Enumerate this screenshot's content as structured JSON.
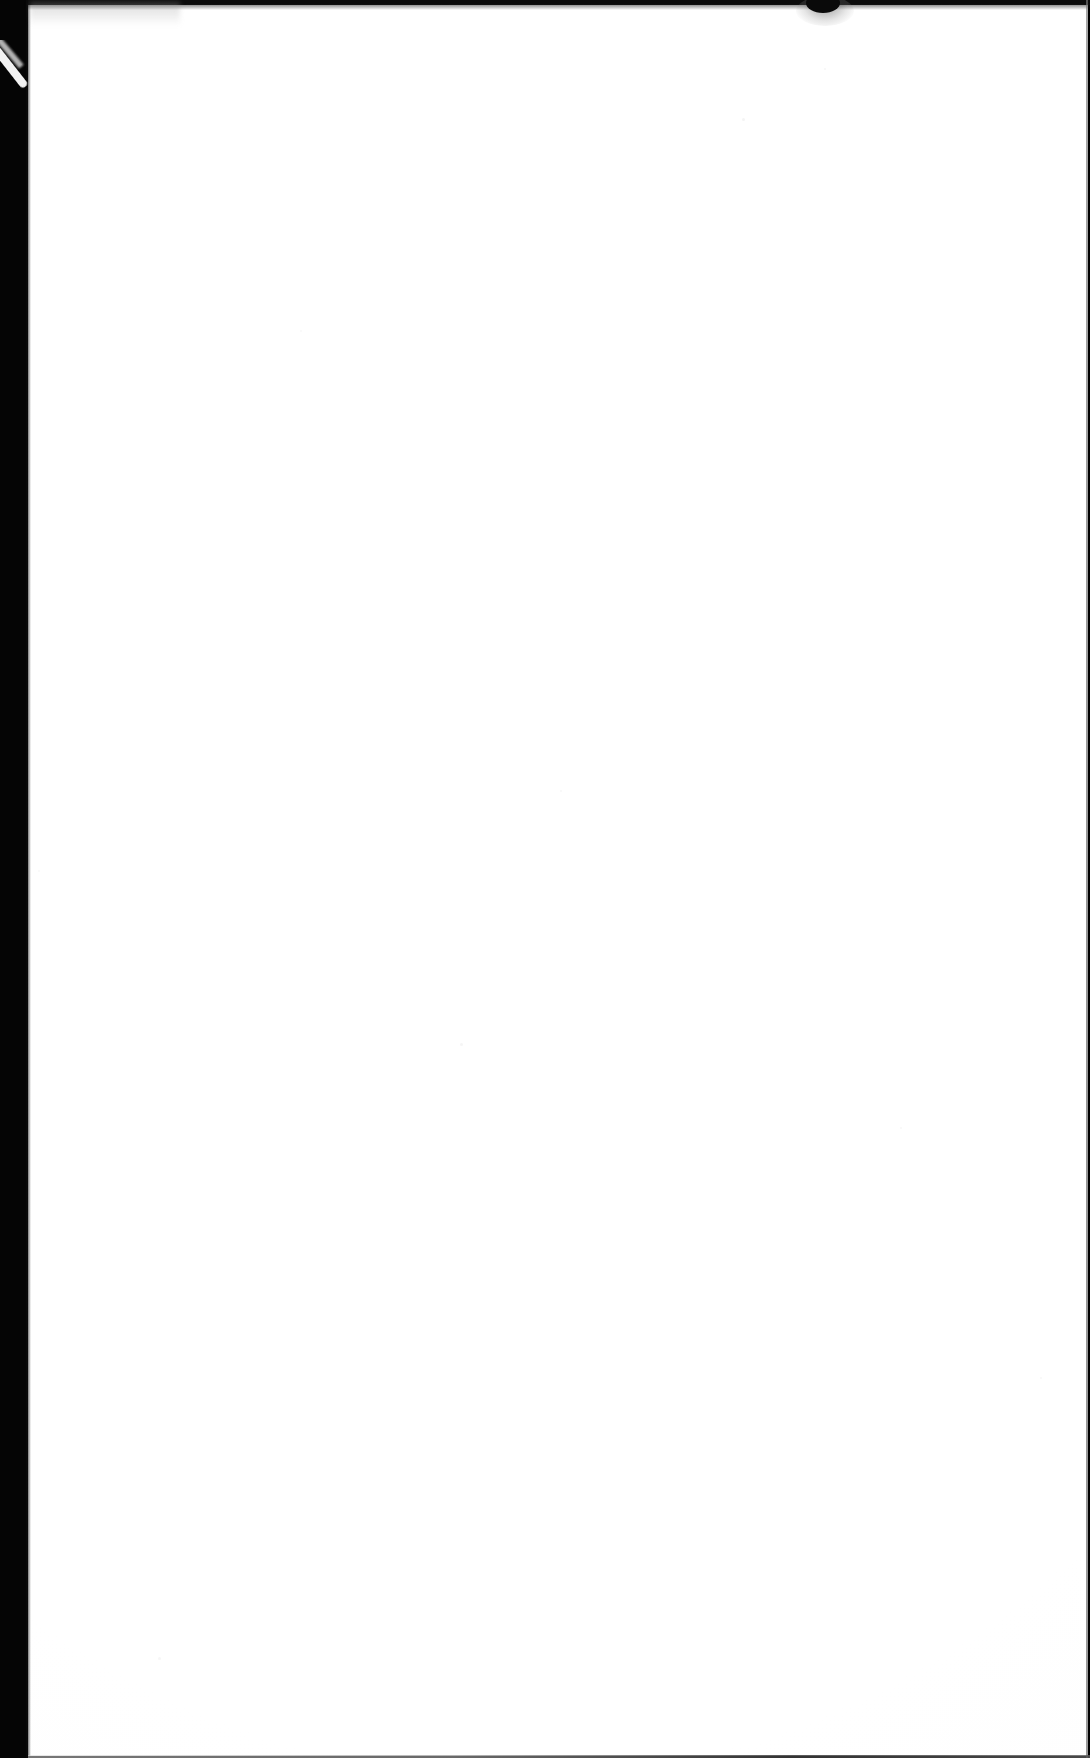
{
  "document": {
    "kind": "scanned-page",
    "title": "Scanned Blank Page",
    "page_content": "",
    "body_text": "",
    "orientation": "portrait",
    "page_width_px": 1090,
    "page_height_px": 1758
  },
  "colors": {
    "scanner_bed": "#050505",
    "paper": "#ffffff",
    "top_band": "#0c0c0c",
    "edge_rule": "#8a8a8a",
    "bottom_rule": "#3c3c3c",
    "blob": "#0a0a0a",
    "sliver": "#f2f2f2"
  },
  "regions": {
    "left_border_label": "",
    "top_border_label": "",
    "right_edge_label": "",
    "bottom_edge_label": "",
    "paper_label": ""
  },
  "artifacts": {
    "top_blob_label": "",
    "corner_sliver_label": "",
    "smudge_label": "",
    "specks": [
      {
        "left": 742,
        "top": 118,
        "size": 3,
        "opacity": 0.35
      },
      {
        "left": 824,
        "top": 68,
        "size": 2,
        "opacity": 0.3
      },
      {
        "left": 560,
        "top": 790,
        "size": 2,
        "opacity": 0.28
      },
      {
        "left": 460,
        "top": 1043,
        "size": 3,
        "opacity": 0.32
      },
      {
        "left": 900,
        "top": 1127,
        "size": 2,
        "opacity": 0.26
      },
      {
        "left": 158,
        "top": 1657,
        "size": 3,
        "opacity": 0.3
      },
      {
        "left": 1040,
        "top": 1377,
        "size": 2,
        "opacity": 0.25
      },
      {
        "left": 38,
        "top": 870,
        "size": 2,
        "opacity": 0.22
      },
      {
        "left": 300,
        "top": 330,
        "size": 2,
        "opacity": 0.2
      }
    ]
  }
}
